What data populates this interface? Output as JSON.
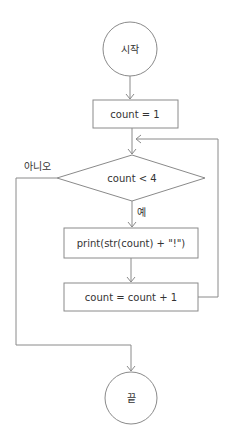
{
  "flowchart": {
    "start": {
      "label": "시작"
    },
    "init": {
      "label": "count = 1"
    },
    "condition": {
      "label": "count < 4"
    },
    "yes_label": "예",
    "no_label": "아니오",
    "print": {
      "label": "print(str(count) + \"!\")"
    },
    "increment": {
      "label": "count = count + 1"
    },
    "end": {
      "label": "끝"
    }
  },
  "colors": {
    "stroke": "#8a8a8a",
    "text": "#333333",
    "background": "#ffffff"
  }
}
